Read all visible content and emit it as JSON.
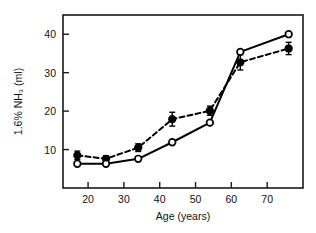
{
  "chart_data": {
    "type": "line",
    "title": "",
    "xlabel": "Age (years)",
    "ylabel": "1.6% NH3 (ml)",
    "ylabel_display": "1.6% NH₃ (ml)",
    "xlim": [
      13,
      80
    ],
    "ylim": [
      0,
      45
    ],
    "xticks": [
      20,
      30,
      40,
      50,
      60,
      70
    ],
    "yticks": [
      10,
      20,
      30,
      40
    ],
    "xtick_labels": [
      "20",
      "30",
      "40",
      "50",
      "60",
      "70"
    ],
    "ytick_labels": [
      "10",
      "20",
      "30",
      "40"
    ],
    "grid": false,
    "legend": "none",
    "frame": "box",
    "series": [
      {
        "name": "filled-circles-dashed",
        "marker": "filled-circle",
        "linestyle": "dashed",
        "color": "#000000",
        "points": [
          {
            "x": 17,
            "y": 8.5,
            "err": 1.1
          },
          {
            "x": 25,
            "y": 7.6,
            "err": 0.8
          },
          {
            "x": 34,
            "y": 10.5,
            "err": 1.0
          },
          {
            "x": 43.5,
            "y": 17.9,
            "err": 1.8
          },
          {
            "x": 54,
            "y": 20.1,
            "err": 1.2
          },
          {
            "x": 62.5,
            "y": 32.7,
            "err": 2.0
          },
          {
            "x": 76,
            "y": 36.3,
            "err": 1.6
          }
        ]
      },
      {
        "name": "open-circles-solid",
        "marker": "open-circle",
        "linestyle": "solid",
        "color": "#000000",
        "points": [
          {
            "x": 17,
            "y": 6.3,
            "err": 0
          },
          {
            "x": 25,
            "y": 6.3,
            "err": 0
          },
          {
            "x": 34,
            "y": 7.6,
            "err": 0
          },
          {
            "x": 43.5,
            "y": 11.9,
            "err": 0
          },
          {
            "x": 54,
            "y": 17.0,
            "err": 0
          },
          {
            "x": 62.5,
            "y": 35.4,
            "err": 0
          },
          {
            "x": 76,
            "y": 40.0,
            "err": 0
          }
        ]
      }
    ]
  }
}
